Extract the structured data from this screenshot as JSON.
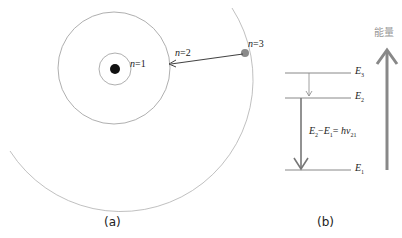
{
  "panel_a": {
    "caption": "(a)",
    "orbits": [
      {
        "label_var": "n",
        "label_eq": "=1",
        "radius": 16
      },
      {
        "label_var": "n",
        "label_eq": "=2",
        "radius": 56
      },
      {
        "label_var": "n",
        "label_eq": "=3",
        "radius": 129
      }
    ],
    "transition": {
      "from": "n=3",
      "to": "n=2"
    }
  },
  "panel_b": {
    "caption": "(b)",
    "axis_label": "能量",
    "levels": [
      {
        "name": "E",
        "sub": "3"
      },
      {
        "name": "E",
        "sub": "2"
      },
      {
        "name": "E",
        "sub": "1"
      }
    ],
    "equation": {
      "lhs_a": "E",
      "lhs_a_sub": "2",
      "minus": "−",
      "lhs_b": "E",
      "lhs_b_sub": "1",
      "eq": "= ",
      "rhs": "hν",
      "rhs_sub": "21"
    }
  },
  "colors": {
    "line": "#888888",
    "orbit": "#9a9a9a",
    "nucleus": "#111111",
    "electron": "#8a8a8a",
    "energy_arrow": "#777777"
  }
}
